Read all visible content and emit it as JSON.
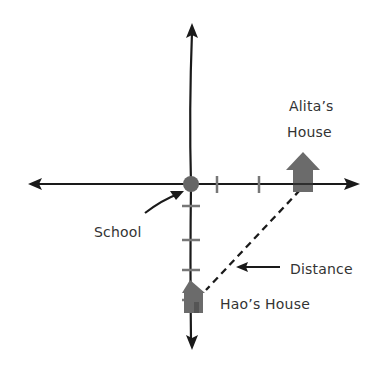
{
  "diagram": {
    "type": "coordinate-plane-map",
    "colors": {
      "axis": "#1a1a1a",
      "marker": "#666666",
      "tick": "#777777",
      "house": "#6b6b6b",
      "text": "#333333",
      "background": "#ffffff"
    },
    "origin": {
      "label": "School",
      "x": 191,
      "y": 184
    },
    "labels": {
      "school": "School",
      "alita_house_line1": "Alita’s",
      "alita_house_line2": "House",
      "hao_house": "Hao’s House",
      "distance": "Distance"
    },
    "horizontal_ticks_x": [
      217,
      259
    ],
    "vertical_ticks_y": [
      206,
      240,
      270
    ],
    "points": [
      {
        "name": "Alita’s House",
        "x": 303,
        "y": 184,
        "icon": "house-icon"
      },
      {
        "name": "Hao’s House",
        "x": 191,
        "y": 296,
        "icon": "house-icon"
      }
    ],
    "segments": [
      {
        "name": "Distance",
        "from": "Alita’s House",
        "to": "Hao’s House",
        "style": "dashed"
      }
    ]
  }
}
